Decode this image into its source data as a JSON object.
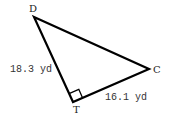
{
  "diagram": {
    "type": "right-triangle",
    "vertices": {
      "D": {
        "label": "D",
        "x": 34,
        "y": 17
      },
      "C": {
        "label": "C",
        "x": 149,
        "y": 69
      },
      "T": {
        "label": "T",
        "x": 73,
        "y": 102
      }
    },
    "right_angle_at": "T",
    "sides": {
      "DT": {
        "label": "18.3 yd"
      },
      "TC": {
        "label": "16.1 yd"
      }
    },
    "stroke_color": "#000000"
  }
}
